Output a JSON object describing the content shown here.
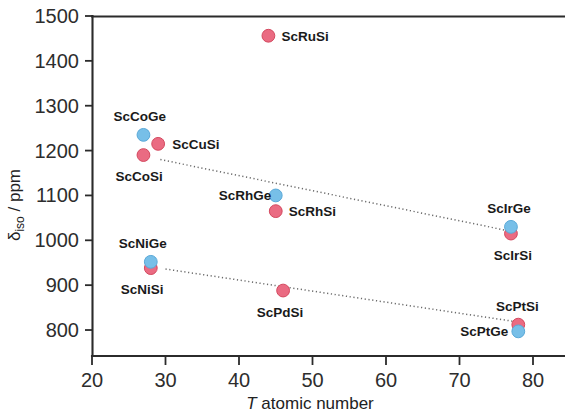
{
  "chart_data": {
    "type": "scatter",
    "title": "",
    "xlabel": "T atomic number",
    "ylabel": "δiso / ppm",
    "ylabel_main": "δ",
    "ylabel_sub": "iso",
    "ylabel_unit": " / ppm",
    "xlim": [
      20,
      86
    ],
    "ylim": [
      770,
      1500
    ],
    "xticks": [
      20,
      30,
      40,
      50,
      60,
      70,
      80
    ],
    "yticks": [
      800,
      900,
      1000,
      1100,
      1200,
      1300,
      1400,
      1500
    ],
    "grid": false,
    "legend": false,
    "series": [
      {
        "name": "Silicides (ScTSi)",
        "color": "#ea6b82",
        "points": [
          {
            "label": "ScCoSi",
            "x": 27,
            "y": 1190,
            "label_dx": -28,
            "label_dy": 26
          },
          {
            "label": "ScCuSi",
            "x": 29,
            "y": 1215,
            "label_dx": 14,
            "label_dy": 5
          },
          {
            "label": "ScRuSi",
            "x": 44,
            "y": 1456,
            "label_dx": 13,
            "label_dy": 5
          },
          {
            "label": "ScRhSi",
            "x": 45,
            "y": 1065,
            "label_dx": 13,
            "label_dy": 5
          },
          {
            "label": "ScIrSi",
            "x": 77,
            "y": 1015,
            "label_dx": 2,
            "label_dy": 26
          },
          {
            "label": "ScNiSi",
            "x": 28,
            "y": 938,
            "label_dx": -30,
            "label_dy": 26
          },
          {
            "label": "ScPdSi",
            "x": 46,
            "y": 888,
            "label_dx": -3,
            "label_dy": 26
          },
          {
            "label": "ScPtSi",
            "x": 78,
            "y": 812,
            "label_dx": -1,
            "label_dy": -14
          }
        ]
      },
      {
        "name": "Germanides (ScTGe)",
        "color": "#77bfe8",
        "points": [
          {
            "label": "ScCoGe",
            "x": 27,
            "y": 1235,
            "label_dx": -30,
            "label_dy": -14
          },
          {
            "label": "ScRhGe",
            "x": 45,
            "y": 1100,
            "label_dx": -57,
            "label_dy": 5
          },
          {
            "label": "ScIrGe",
            "x": 77,
            "y": 1030,
            "label_dx": -2,
            "label_dy": -14
          },
          {
            "label": "ScNiGe",
            "x": 28,
            "y": 952,
            "label_dx": -32,
            "label_dy": -14
          },
          {
            "label": "ScPtGe",
            "x": 78,
            "y": 797,
            "label_dx": -58,
            "label_dy": 5
          }
        ]
      }
    ],
    "trendlines": [
      {
        "name": "upper-trendline",
        "x1": 29.3,
        "y1": 1180,
        "x2": 77.0,
        "y2": 1020
      },
      {
        "name": "lower-trendline",
        "x1": 30.0,
        "y1": 936,
        "x2": 78.3,
        "y2": 817
      }
    ]
  }
}
